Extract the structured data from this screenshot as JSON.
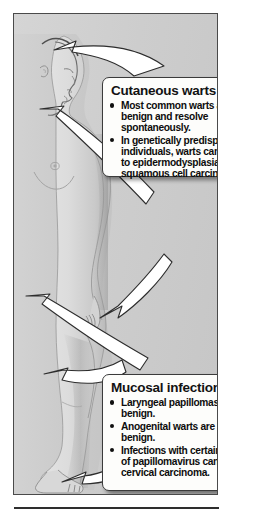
{
  "figure": {
    "alt": "Side profile silhouette of a human body with arrows indicating sites of papillomavirus infection"
  },
  "colors": {
    "panel_background": "#cfcfcf",
    "panel_border": "#4a4a4a",
    "body_fill": "#dcdcdc",
    "body_shadow": "#9a9a9a",
    "callout_background": "#fdfdfb",
    "callout_border": "#3b3b3b",
    "arrow_fill": "#ffffff",
    "arrow_outline": "#2a2a2a",
    "text": "#101010",
    "rule": "#2e2e2e"
  },
  "callouts": [
    {
      "id": "cutaneous",
      "title": "Cutaneous warts",
      "bullets": [
        "Most common warts are benign and resolve spontaneously.",
        "In genetically predisposed individuals, warts can lead to epidermodysplasia and squamous cell carcinoma."
      ]
    },
    {
      "id": "mucosal",
      "title": "Mucosal infections",
      "bullets": [
        "Laryngeal papillomas are benign.",
        "Anogenital warts are usually benign.",
        " Infections with certain types of papillomavirus can lead to cervical carcinoma."
      ]
    }
  ],
  "arrows": [
    {
      "name": "arrow-to-scalp",
      "target": "scalp",
      "source_callout": "cutaneous"
    },
    {
      "name": "arrow-to-neck",
      "target": "neck",
      "source_callout": "cutaneous"
    },
    {
      "name": "arrow-to-hand",
      "target": "hand",
      "source_callout": "cutaneous"
    },
    {
      "name": "arrow-to-flank",
      "target": "flank",
      "source_callout": "mucosal"
    },
    {
      "name": "arrow-to-genital",
      "target": "genital-region",
      "source_callout": "mucosal"
    },
    {
      "name": "arrow-to-foot",
      "target": "foot",
      "source_callout": "mucosal"
    }
  ]
}
